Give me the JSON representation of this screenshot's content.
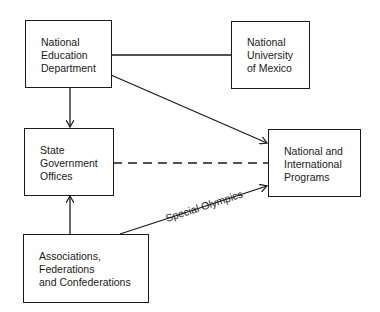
{
  "diagram": {
    "nodes": {
      "ned": {
        "label": "National\nEducation\nDepartment"
      },
      "unam": {
        "label": "National\nUniversity\nof Mexico"
      },
      "state": {
        "label": "State\nGovernment\nOffices"
      },
      "programs": {
        "label": "National and\nInternational\nPrograms"
      },
      "assoc": {
        "label": "Associations,\nFederations\nand Confederations"
      }
    },
    "edges": [
      {
        "from": "ned",
        "to": "unam",
        "style": "solid",
        "arrow": false
      },
      {
        "from": "ned",
        "to": "programs",
        "style": "solid",
        "arrow": true
      },
      {
        "from": "ned",
        "to": "state",
        "style": "solid",
        "arrow": true
      },
      {
        "from": "state",
        "to": "programs",
        "style": "dashed",
        "arrow": false
      },
      {
        "from": "assoc",
        "to": "state",
        "style": "solid",
        "arrow": true
      },
      {
        "from": "assoc",
        "to": "programs",
        "style": "solid",
        "arrow": true,
        "label": "Special Olympics"
      }
    ],
    "edge_labels": {
      "special_olympics": "Special Olympics"
    }
  }
}
